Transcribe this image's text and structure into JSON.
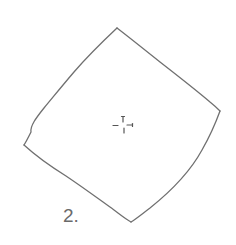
{
  "figure": {
    "label": "2.",
    "shape": "rotated-square",
    "stroke_color": "#6f6f6f",
    "label_color": "#6a6a6a",
    "background": "#ffffff",
    "corners": {
      "top": [
        117,
        28
      ],
      "right": [
        220,
        111
      ],
      "bottom": [
        131,
        222
      ],
      "left": [
        24,
        145
      ]
    },
    "center_mark": "crosshair-icon"
  }
}
